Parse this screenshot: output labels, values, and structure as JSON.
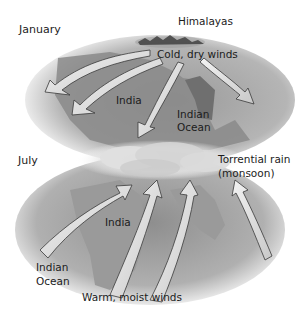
{
  "diagram": {
    "panels": [
      {
        "season": "January",
        "labels": {
          "mountains": "Himalayas",
          "winds": "Cold, dry winds",
          "land": "India",
          "sea": "Indian Ocean"
        },
        "wind_direction": "from Himalayas outward toward ocean (southwest)"
      },
      {
        "season": "July",
        "labels": {
          "rain": "Torrential rain (monsoon)",
          "land": "India",
          "sea": "Indian Ocean",
          "winds": "Warm, moist winds"
        },
        "wind_direction": "from Indian Ocean inward toward Himalayas (northeast)"
      }
    ],
    "text": {
      "january": "January",
      "himalayas": "Himalayas",
      "cold_dry_winds": "Cold, dry winds",
      "india_jan": "India",
      "indian_ocean_jan_line1": "Indian",
      "indian_ocean_jan_line2": "Ocean",
      "july": "July",
      "torrential_rain_line1": "Torrential rain",
      "torrential_rain_line2": "(monsoon)",
      "india_jul": "India",
      "indian_ocean_jul_line1": "Indian",
      "indian_ocean_jul_line2": "Ocean",
      "warm_moist_winds": "Warm, moist winds"
    },
    "colors": {
      "background": "#ffffff",
      "land": "#8a8a8a",
      "sea": "#b8b8b8",
      "arrow_fill": "#e8e8e8",
      "arrow_shadow": "#3a3a3a",
      "cloud": "#d9d9d9"
    }
  }
}
